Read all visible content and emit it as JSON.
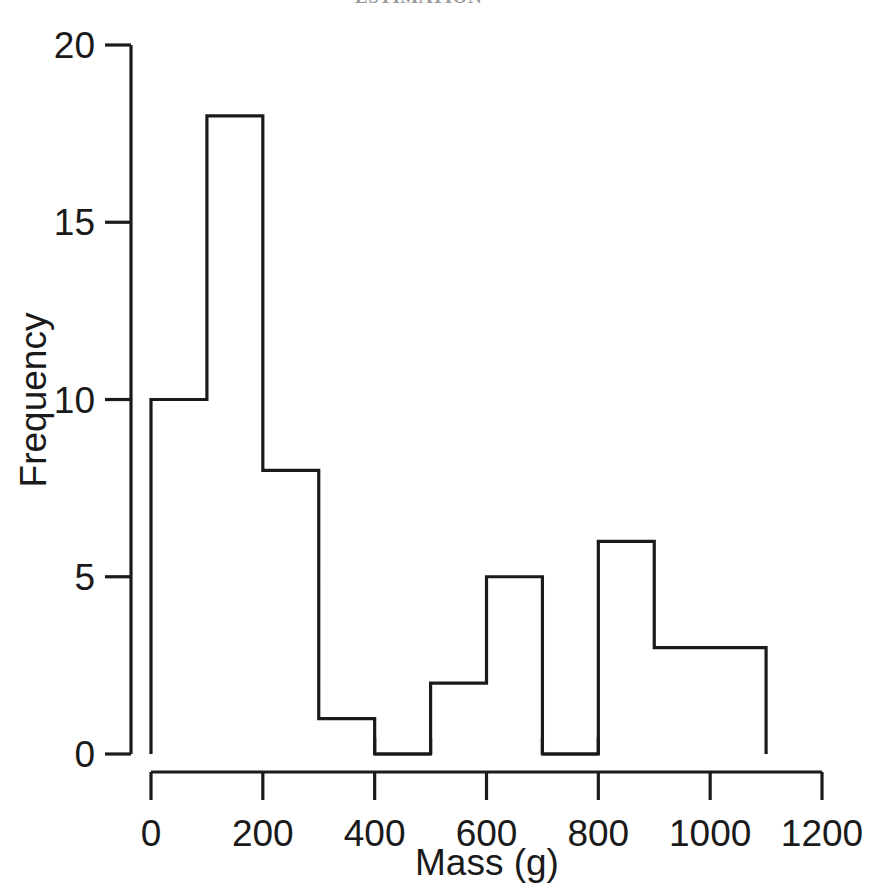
{
  "page": {
    "background_color": "#ffffff",
    "ink_color": "#1a1a1a",
    "cropped_header_text": "ESTIMATION"
  },
  "chart_data": {
    "type": "bar",
    "subtype": "histogram",
    "title": "",
    "xlabel": "Mass (g)",
    "ylabel": "Frequency",
    "xlim": [
      0,
      1200
    ],
    "ylim": [
      0,
      20
    ],
    "xticks": [
      0,
      200,
      400,
      600,
      800,
      1000,
      1200
    ],
    "xtick_labels": [
      "0",
      "200",
      "400",
      "600",
      "800",
      "1000",
      "1200"
    ],
    "yticks": [
      0,
      5,
      10,
      15,
      20
    ],
    "ytick_labels": [
      "0",
      "5",
      "10",
      "15",
      "20"
    ],
    "x_minor_tick_step": 100,
    "grid": false,
    "legend": false,
    "bin_width": 100,
    "bin_edges": [
      0,
      100,
      200,
      300,
      400,
      500,
      600,
      700,
      800,
      900,
      1000,
      1100
    ],
    "categories": [
      "0-100",
      "100-200",
      "200-300",
      "300-400",
      "400-500",
      "500-600",
      "600-700",
      "700-800",
      "800-900",
      "900-1000",
      "1000-1100"
    ],
    "values": [
      10,
      18,
      8,
      1,
      0,
      2,
      5,
      0,
      6,
      3,
      3
    ],
    "bar_fill": "none",
    "bar_stroke": "#1a1a1a",
    "bar_stroke_width": 3,
    "total_count": 56
  }
}
